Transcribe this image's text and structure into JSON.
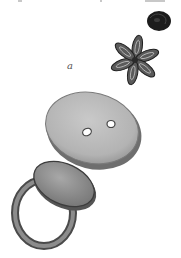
{
  "image": {
    "description": "Pencil/ink illustration of jewelry items: a small dark rounded button, a six-petal flower-shaped ornament, a large oval two-hole button, and a ring with an oval flat bezel",
    "caption_label": "a",
    "items": [
      {
        "name": "dark-round-button",
        "position": "top-right"
      },
      {
        "name": "flower-ornament",
        "position": "upper-right"
      },
      {
        "name": "oval-two-hole-button",
        "position": "center"
      },
      {
        "name": "signet-ring",
        "position": "lower-left"
      }
    ],
    "colors": {
      "background": "#ffffff",
      "ink_dark": "#1a1a1a",
      "button_fill": "#b8b8b8",
      "button_edge": "#6a6a6a",
      "ring_fill": "#9a9a9a"
    }
  }
}
